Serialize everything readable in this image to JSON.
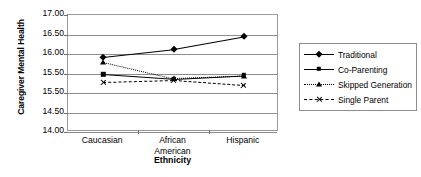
{
  "chart_data": {
    "type": "line",
    "title": "",
    "xlabel": "Ethnicity",
    "ylabel": "Caregiver Mental Health",
    "categories": [
      "Caucasian",
      "African American",
      "Hispanic"
    ],
    "ytick_labels": [
      "17.00",
      "16.50",
      "16.00",
      "15.50",
      "15.50",
      "14.50",
      "14.00"
    ],
    "ytick_values": [
      17.0,
      16.5,
      16.0,
      15.5,
      15.0,
      14.5,
      14.0
    ],
    "ylim": [
      14.0,
      17.0
    ],
    "grid": "horizontal",
    "legend_position": "right",
    "series": [
      {
        "name": "Traditional",
        "marker": "diamond",
        "line_style": "solid",
        "color": "#000000",
        "values": [
          15.93,
          16.13,
          16.45
        ]
      },
      {
        "name": "Co-Parenting",
        "marker": "square",
        "line_style": "solid",
        "color": "#000000",
        "values": [
          15.48,
          15.36,
          15.45
        ]
      },
      {
        "name": "Skipped Generation",
        "marker": "triangle",
        "line_style": "dotted",
        "color": "#000000",
        "values": [
          15.8,
          15.38,
          15.44
        ]
      },
      {
        "name": "Single Parent",
        "marker": "cross",
        "line_style": "dash-dot",
        "color": "#000000",
        "values": [
          15.28,
          15.33,
          15.2
        ]
      }
    ]
  },
  "legend": {
    "items": [
      {
        "label": "Traditional"
      },
      {
        "label": "Co-Parenting"
      },
      {
        "label": "Skipped Generation"
      },
      {
        "label": "Single Parent"
      }
    ]
  }
}
